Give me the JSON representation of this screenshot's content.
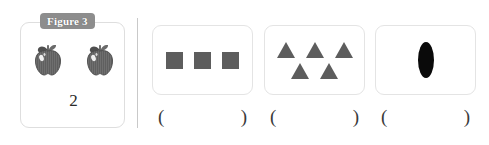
{
  "worksheet": {
    "example": {
      "badge_label": "Figure 3",
      "icon_name": "apple-icon",
      "item_count_label": "2",
      "items": 2
    },
    "divider_name": "vertical-divider",
    "questions": [
      {
        "id": "q1",
        "shape_name": "square",
        "shape_count": 3,
        "rows": [
          3
        ],
        "color": "#5d5d5d",
        "answer_open": "(",
        "answer_close": ")",
        "answer_value": ""
      },
      {
        "id": "q2",
        "shape_name": "triangle",
        "shape_count": 5,
        "rows": [
          3,
          2
        ],
        "color": "#5d5d5d",
        "answer_open": "(",
        "answer_close": ")",
        "answer_value": ""
      },
      {
        "id": "q3",
        "shape_name": "ellipse",
        "shape_count": 1,
        "rows": [
          1
        ],
        "color": "#0a0a0a",
        "answer_open": "(",
        "answer_close": ")",
        "answer_value": ""
      }
    ],
    "colors": {
      "badge_background": "#8d8d8d",
      "badge_text": "#ffffff",
      "box_border": "#e4e4e4",
      "example_box_border": "#dedede",
      "divider": "#c9c9c9",
      "shape_gray": "#5d5d5d",
      "shape_black": "#0a0a0a",
      "apple_body": "#707070",
      "page_background": "#ffffff"
    }
  }
}
